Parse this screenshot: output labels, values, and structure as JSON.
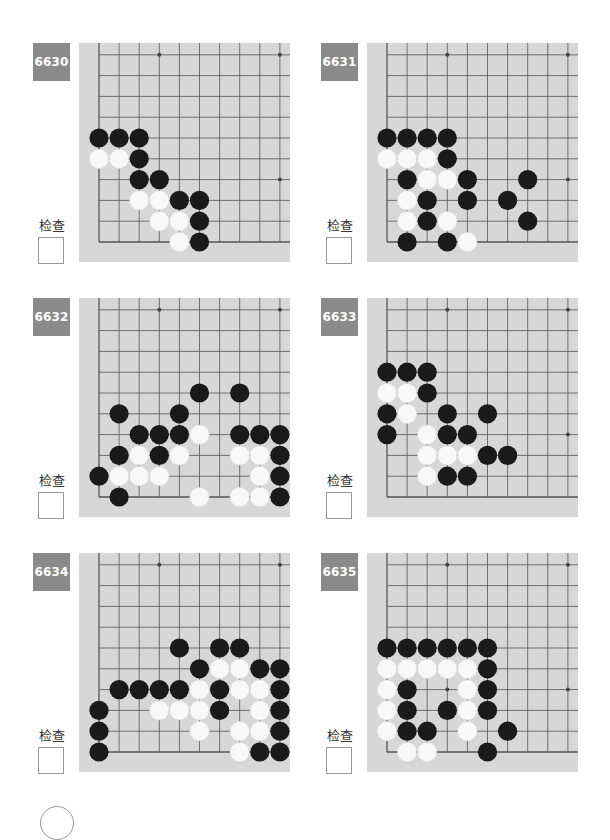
{
  "check_label": "检查",
  "colors": {
    "label_bg": "#8a8a8a",
    "board_bg": "#d7d7d7",
    "grid_line": "#555555",
    "black_stone": "#1a1a1a",
    "white_stone": "#f8f8f8"
  },
  "problems": [
    {
      "id": "6630",
      "stones": {
        "black": [
          [
            0,
            5
          ],
          [
            1,
            5
          ],
          [
            2,
            5
          ],
          [
            2,
            4
          ],
          [
            2,
            3
          ],
          [
            3,
            3
          ],
          [
            4,
            2
          ],
          [
            5,
            2
          ],
          [
            5,
            1
          ],
          [
            5,
            0
          ]
        ],
        "white": [
          [
            0,
            4
          ],
          [
            1,
            4
          ],
          [
            2,
            2
          ],
          [
            3,
            2
          ],
          [
            3,
            1
          ],
          [
            4,
            1
          ],
          [
            4,
            0
          ]
        ]
      }
    },
    {
      "id": "6631",
      "stones": {
        "black": [
          [
            0,
            5
          ],
          [
            1,
            5
          ],
          [
            2,
            5
          ],
          [
            3,
            5
          ],
          [
            3,
            4
          ],
          [
            1,
            3
          ],
          [
            4,
            3
          ],
          [
            7,
            3
          ],
          [
            2,
            2
          ],
          [
            4,
            2
          ],
          [
            6,
            2
          ],
          [
            2,
            1
          ],
          [
            7,
            1
          ],
          [
            1,
            0
          ],
          [
            3,
            0
          ]
        ],
        "white": [
          [
            0,
            4
          ],
          [
            1,
            4
          ],
          [
            2,
            4
          ],
          [
            2,
            3
          ],
          [
            3,
            3
          ],
          [
            1,
            2
          ],
          [
            1,
            1
          ],
          [
            3,
            1
          ],
          [
            4,
            0
          ]
        ]
      }
    },
    {
      "id": "6632",
      "stones": {
        "black": [
          [
            5,
            5
          ],
          [
            7,
            5
          ],
          [
            1,
            4
          ],
          [
            4,
            4
          ],
          [
            2,
            3
          ],
          [
            3,
            3
          ],
          [
            4,
            3
          ],
          [
            7,
            3
          ],
          [
            8,
            3
          ],
          [
            9,
            3
          ],
          [
            1,
            2
          ],
          [
            3,
            2
          ],
          [
            9,
            2
          ],
          [
            0,
            1
          ],
          [
            9,
            1
          ],
          [
            1,
            0
          ],
          [
            9,
            0
          ]
        ],
        "white": [
          [
            5,
            3
          ],
          [
            2,
            2
          ],
          [
            4,
            2
          ],
          [
            7,
            2
          ],
          [
            8,
            2
          ],
          [
            1,
            1
          ],
          [
            2,
            1
          ],
          [
            3,
            1
          ],
          [
            8,
            1
          ],
          [
            5,
            0
          ],
          [
            7,
            0
          ],
          [
            8,
            0
          ]
        ]
      }
    },
    {
      "id": "6633",
      "stones": {
        "black": [
          [
            0,
            6
          ],
          [
            1,
            6
          ],
          [
            2,
            6
          ],
          [
            2,
            5
          ],
          [
            0,
            4
          ],
          [
            3,
            4
          ],
          [
            5,
            4
          ],
          [
            0,
            3
          ],
          [
            3,
            3
          ],
          [
            4,
            3
          ],
          [
            5,
            2
          ],
          [
            6,
            2
          ],
          [
            3,
            1
          ],
          [
            4,
            1
          ]
        ],
        "white": [
          [
            0,
            5
          ],
          [
            1,
            5
          ],
          [
            1,
            4
          ],
          [
            2,
            3
          ],
          [
            2,
            2
          ],
          [
            3,
            2
          ],
          [
            4,
            2
          ],
          [
            2,
            1
          ]
        ]
      }
    },
    {
      "id": "6634",
      "stones": {
        "black": [
          [
            4,
            5
          ],
          [
            6,
            5
          ],
          [
            7,
            5
          ],
          [
            5,
            4
          ],
          [
            8,
            4
          ],
          [
            9,
            4
          ],
          [
            1,
            3
          ],
          [
            2,
            3
          ],
          [
            3,
            3
          ],
          [
            4,
            3
          ],
          [
            6,
            3
          ],
          [
            9,
            3
          ],
          [
            0,
            2
          ],
          [
            6,
            2
          ],
          [
            9,
            2
          ],
          [
            0,
            1
          ],
          [
            9,
            1
          ],
          [
            0,
            0
          ],
          [
            8,
            0
          ],
          [
            9,
            0
          ]
        ],
        "white": [
          [
            6,
            4
          ],
          [
            7,
            4
          ],
          [
            5,
            3
          ],
          [
            7,
            3
          ],
          [
            8,
            3
          ],
          [
            3,
            2
          ],
          [
            4,
            2
          ],
          [
            5,
            2
          ],
          [
            8,
            2
          ],
          [
            5,
            1
          ],
          [
            7,
            1
          ],
          [
            8,
            1
          ],
          [
            7,
            0
          ]
        ]
      }
    },
    {
      "id": "6635",
      "stones": {
        "black": [
          [
            0,
            5
          ],
          [
            1,
            5
          ],
          [
            2,
            5
          ],
          [
            3,
            5
          ],
          [
            4,
            5
          ],
          [
            5,
            5
          ],
          [
            5,
            4
          ],
          [
            1,
            3
          ],
          [
            5,
            3
          ],
          [
            1,
            2
          ],
          [
            3,
            2
          ],
          [
            5,
            2
          ],
          [
            1,
            1
          ],
          [
            2,
            1
          ],
          [
            6,
            1
          ],
          [
            5,
            0
          ]
        ],
        "white": [
          [
            0,
            4
          ],
          [
            1,
            4
          ],
          [
            2,
            4
          ],
          [
            3,
            4
          ],
          [
            4,
            4
          ],
          [
            0,
            3
          ],
          [
            4,
            3
          ],
          [
            0,
            2
          ],
          [
            4,
            2
          ],
          [
            0,
            1
          ],
          [
            4,
            1
          ],
          [
            1,
            0
          ],
          [
            2,
            0
          ]
        ]
      }
    }
  ]
}
